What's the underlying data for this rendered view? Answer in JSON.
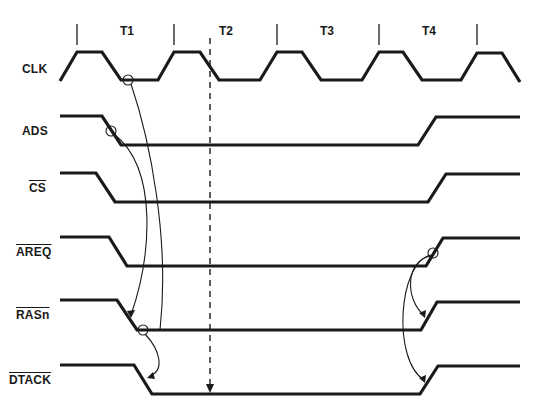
{
  "diagram": {
    "type": "timing-diagram",
    "periods": [
      {
        "label": "T1"
      },
      {
        "label": "T2"
      },
      {
        "label": "T3"
      },
      {
        "label": "T4"
      }
    ],
    "signals": [
      {
        "name": "CLK",
        "active_low": false
      },
      {
        "name": "ADS",
        "active_low": false
      },
      {
        "name": "CS",
        "active_low": true
      },
      {
        "name": "AREQ",
        "active_low": true
      },
      {
        "name": "RASn",
        "active_low": true
      },
      {
        "name": "DTACK",
        "active_low": true
      }
    ],
    "causal_arrows": [
      {
        "from": "CLK falling (T1)",
        "to": "RASn falling"
      },
      {
        "from": "ADS falling",
        "to": "RASn falling"
      },
      {
        "from": "RASn falling",
        "to": "DTACK falling"
      },
      {
        "from": "AREQ rising (T4)",
        "to": "RASn rising"
      },
      {
        "from": "AREQ rising (T4)",
        "to": "DTACK rising"
      }
    ],
    "markers": [
      {
        "type": "dashed-vertical-line",
        "position": "T2 start",
        "ends_with": "arrow on DTACK"
      }
    ]
  }
}
